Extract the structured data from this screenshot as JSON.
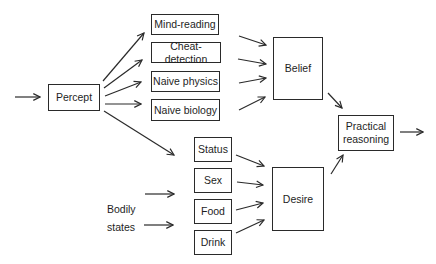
{
  "diagram": {
    "nodes": {
      "percept": "Percept",
      "mind_reading": "Mind-reading",
      "cheat_detection": "Cheat-detection",
      "naive_physics": "Naive physics",
      "naive_biology": "Naive biology",
      "belief": "Belief",
      "status": "Status",
      "sex": "Sex",
      "food": "Food",
      "drink": "Drink",
      "desire": "Desire",
      "practical_reasoning": "Practical reasoning",
      "bodily_states_line1": "Bodily",
      "bodily_states_line2": "states"
    },
    "edges": [
      [
        "input",
        "Percept"
      ],
      [
        "Percept",
        "Mind-reading"
      ],
      [
        "Percept",
        "Cheat-detection"
      ],
      [
        "Percept",
        "Naive physics"
      ],
      [
        "Percept",
        "Naive biology"
      ],
      [
        "Percept",
        "Status"
      ],
      [
        "Mind-reading",
        "Belief"
      ],
      [
        "Cheat-detection",
        "Belief"
      ],
      [
        "Naive physics",
        "Belief"
      ],
      [
        "Naive biology",
        "Belief"
      ],
      [
        "Bodily states",
        "Sex"
      ],
      [
        "Bodily states",
        "Food"
      ],
      [
        "Status",
        "Desire"
      ],
      [
        "Sex",
        "Desire"
      ],
      [
        "Food",
        "Desire"
      ],
      [
        "Drink",
        "Desire"
      ],
      [
        "Belief",
        "Practical reasoning"
      ],
      [
        "Desire",
        "Practical reasoning"
      ],
      [
        "Practical reasoning",
        "output"
      ]
    ]
  }
}
